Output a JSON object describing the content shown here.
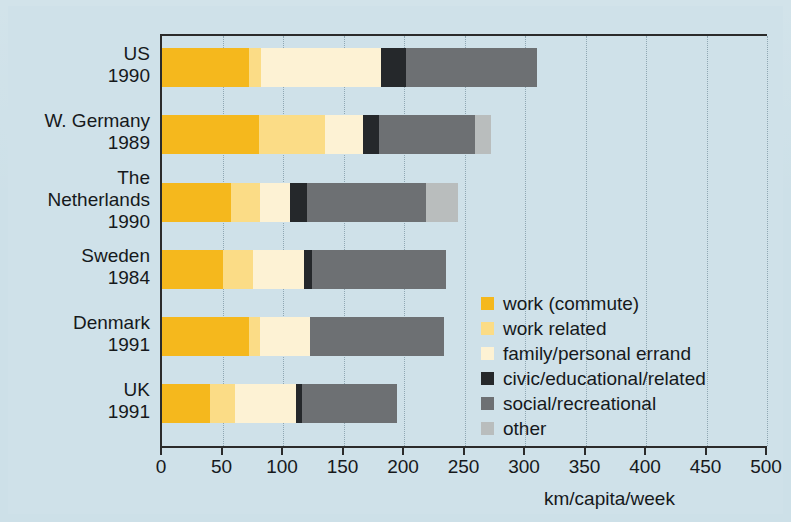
{
  "chart_data": {
    "type": "bar",
    "orientation": "horizontal",
    "stacked": true,
    "title": "",
    "xlabel": "km/capita/week",
    "ylabel": "",
    "xlim": [
      0,
      500
    ],
    "xticks": [
      0,
      50,
      100,
      150,
      200,
      250,
      300,
      350,
      400,
      450,
      500
    ],
    "grid": "vertical-dotted",
    "legend_position": "inside-right-lower",
    "categories": [
      "US 1990",
      "W. Germany 1989",
      "The Netherlands 1990",
      "Sweden 1984",
      "Denmark 1991",
      "UK 1991"
    ],
    "category_lines": [
      [
        "US",
        "1990"
      ],
      [
        "W. Germany",
        "1989"
      ],
      [
        "The",
        "Netherlands",
        "1990"
      ],
      [
        "Sweden",
        "1984"
      ],
      [
        "Denmark",
        "1991"
      ],
      [
        "UK",
        "1991"
      ]
    ],
    "series": [
      {
        "name": "work (commute)",
        "color": "#f5b81d",
        "values": [
          72,
          80,
          57,
          50,
          72,
          40
        ]
      },
      {
        "name": "work related",
        "color": "#fbdc86",
        "values": [
          10,
          55,
          24,
          25,
          9,
          20
        ]
      },
      {
        "name": "family/personal errand",
        "color": "#fdf2d4",
        "values": [
          99,
          31,
          25,
          42,
          41,
          51
        ]
      },
      {
        "name": "civic/educational/related",
        "color": "#25282b",
        "values": [
          21,
          13,
          14,
          7,
          0,
          5
        ]
      },
      {
        "name": "social/recreational",
        "color": "#6d7073",
        "values": [
          108,
          80,
          98,
          111,
          111,
          78
        ]
      },
      {
        "name": "other",
        "color": "#b9bdbd",
        "values": [
          0,
          13,
          27,
          0,
          0,
          0
        ]
      }
    ],
    "totals": [
      310,
      272,
      245,
      235,
      233,
      194
    ]
  },
  "legend": {
    "items": [
      {
        "label": "work (commute)",
        "color": "#f5b81d"
      },
      {
        "label": "work related",
        "color": "#fbdc86"
      },
      {
        "label": "family/personal errand",
        "color": "#fdf2d4"
      },
      {
        "label": "civic/educational/related",
        "color": "#25282b"
      },
      {
        "label": "social/recreational",
        "color": "#6d7073"
      },
      {
        "label": "other",
        "color": "#b9bdbd"
      }
    ]
  },
  "axis": {
    "x_title": "km/capita/week",
    "tick_labels": [
      "0",
      "50",
      "100",
      "150",
      "200",
      "250",
      "300",
      "350",
      "400",
      "450",
      "500"
    ]
  },
  "colors": {
    "background": "#cfe1e9",
    "axis": "#2b2b2b",
    "text": "#16191c",
    "gridline": "#8fa7b3"
  }
}
